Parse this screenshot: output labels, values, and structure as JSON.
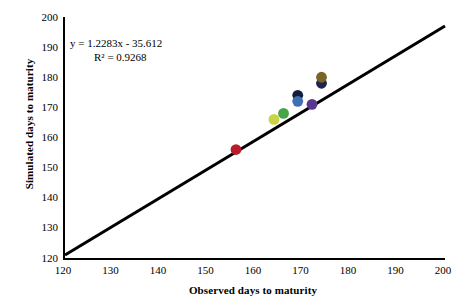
{
  "chart_data": {
    "type": "scatter",
    "title": "",
    "xlabel": "Observed days to maturity",
    "ylabel": "Simulated days to maturity",
    "xlim": [
      120,
      200
    ],
    "ylim": [
      120,
      200
    ],
    "xticks": [
      120,
      130,
      140,
      150,
      160,
      170,
      180,
      190,
      200
    ],
    "yticks": [
      120,
      130,
      140,
      150,
      160,
      170,
      180,
      190,
      200
    ],
    "grid": false,
    "legend": "none",
    "annotations": {
      "equation": "y = 1.2283x - 35.612",
      "r_squared": "R² = 0.9268",
      "slope": 1.2283,
      "intercept": -35.612,
      "r2_value": 0.9268
    },
    "reference_line": {
      "name": "1:1 line",
      "from": [
        120,
        121
      ],
      "to": [
        200,
        197
      ],
      "color": "#000000",
      "width": 3
    },
    "points": [
      {
        "name": "point-red",
        "x": 156,
        "y": 156,
        "color": "#b81e2a"
      },
      {
        "name": "point-yellowgreen",
        "x": 164,
        "y": 166,
        "color": "#c8d442"
      },
      {
        "name": "point-green",
        "x": 166,
        "y": 168,
        "color": "#47a447"
      },
      {
        "name": "point-navy-dark",
        "x": 169,
        "y": 174,
        "color": "#141d3c"
      },
      {
        "name": "point-blue",
        "x": 169,
        "y": 172,
        "color": "#3f6fb5"
      },
      {
        "name": "point-purple",
        "x": 172,
        "y": 171,
        "color": "#58378f"
      },
      {
        "name": "point-navy-deep",
        "x": 174,
        "y": 178,
        "color": "#1b2550"
      },
      {
        "name": "point-brown",
        "x": 174,
        "y": 180,
        "color": "#7a6526"
      }
    ]
  }
}
